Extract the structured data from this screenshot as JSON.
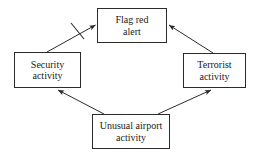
{
  "diagram": {
    "type": "directed-graph",
    "background_color": "#ffffff",
    "line_color": "#2b2b2b",
    "text_color": "#1a1a1a",
    "nodes": [
      {
        "id": "flag-red-alert",
        "label": "Flag red\nalert",
        "x": 97,
        "y": 8,
        "width": 70,
        "height": 35
      },
      {
        "id": "security",
        "label": "Security\nactivity",
        "x": 14,
        "y": 52,
        "width": 67,
        "height": 36
      },
      {
        "id": "terrorist",
        "label": "Terrorist\nactivity",
        "x": 183,
        "y": 53,
        "width": 63,
        "height": 35
      },
      {
        "id": "unusual-airport",
        "label": "Unusual airport\nactivity",
        "x": 92,
        "y": 114,
        "width": 78,
        "height": 35
      }
    ],
    "edges": [
      {
        "id": "security-to-flag-red-alert",
        "from": "security",
        "to": "flag-red-alert",
        "arrowhead": "at-target",
        "negated": true,
        "negation_marker": "slash"
      },
      {
        "id": "terrorist-to-flag-red-alert",
        "from": "terrorist",
        "to": "flag-red-alert",
        "arrowhead": "at-target",
        "negated": false
      },
      {
        "id": "unusual-airport-to-security",
        "from": "unusual-airport",
        "to": "security",
        "arrowhead": "at-target",
        "negated": false
      },
      {
        "id": "unusual-airport-to-terrorist",
        "from": "unusual-airport",
        "to": "terrorist",
        "arrowhead": "at-target",
        "negated": false
      }
    ]
  }
}
